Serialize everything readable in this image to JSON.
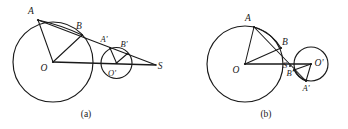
{
  "figure": {
    "type": "geometry-diagram",
    "panels": [
      {
        "id": "a",
        "caption": "(a)",
        "caption_pos": {
          "x": 86,
          "y": 116
        },
        "description": "Two externally separated circles with a common external tangent-like transversal meeting at external homothety center S",
        "circles": [
          {
            "name": "big-circle",
            "cx": 53,
            "cy": 62,
            "r": 40,
            "center_label": "O",
            "center_label_pos": {
              "x": 44,
              "y": 70
            }
          },
          {
            "name": "small-circle",
            "cx": 116.5,
            "cy": 63,
            "r": 15.5,
            "center_label": "O'",
            "center_label_pos": {
              "x": 110,
              "y": 75
            }
          }
        ],
        "points": [
          {
            "label": "A",
            "x": 38,
            "y": 20,
            "label_x": 31,
            "label_y": 14
          },
          {
            "label": "B",
            "x": 82,
            "y": 35,
            "label_x": 79,
            "label_y": 29
          },
          {
            "label": "A'",
            "x": 110,
            "y": 48,
            "label_x": 104,
            "label_y": 42
          },
          {
            "label": "B'",
            "x": 127,
            "y": 54,
            "label_x": 123,
            "label_y": 47
          },
          {
            "label": "O",
            "x": 53,
            "y": 62,
            "label_x": 44,
            "label_y": 71
          },
          {
            "label": "O'",
            "x": 116.5,
            "y": 63,
            "label_x": 110,
            "label_y": 75
          },
          {
            "label": "S",
            "x": 156,
            "y": 65,
            "label_x": 159,
            "label_y": 68
          }
        ],
        "segments": [
          {
            "name": "OA",
            "from": "O",
            "to": "A"
          },
          {
            "name": "OB",
            "from": "O",
            "to": "B"
          },
          {
            "name": "OS-axis",
            "from": "O",
            "to": "S"
          },
          {
            "name": "OprimeA-prime",
            "from": "O'",
            "to": "A'"
          },
          {
            "name": "OprimeB-prime",
            "from": "O'",
            "to": "B'"
          },
          {
            "name": "transversal-A-S",
            "from": "A",
            "to": "S"
          }
        ]
      },
      {
        "id": "b",
        "caption": "(b)",
        "caption_pos": {
          "x": 266,
          "y": 116
        },
        "description": "Two tangent circles with transversal through the internal homothety center S between them",
        "circles": [
          {
            "name": "big-circle",
            "cx": 245,
            "cy": 64,
            "r": 38,
            "center_label": "O",
            "center_label_pos": {
              "x": 236,
              "y": 72
            }
          },
          {
            "name": "small-circle",
            "cx": 311,
            "cy": 64,
            "r": 17,
            "center_label": "O'",
            "center_label_pos": {
              "x": 314,
              "y": 64
            }
          }
        ],
        "points": [
          {
            "label": "A",
            "x": 254,
            "y": 27,
            "label_x": 248,
            "label_y": 21
          },
          {
            "label": "B",
            "x": 281,
            "y": 48,
            "label_x": 283,
            "label_y": 44
          },
          {
            "label": "S",
            "x": 290,
            "y": 66,
            "label_x": 284,
            "label_y": 66
          },
          {
            "label": "B'",
            "x": 294,
            "y": 70,
            "label_x": 289,
            "label_y": 74
          },
          {
            "label": "A'",
            "x": 306,
            "y": 81,
            "label_x": 305,
            "label_y": 89
          },
          {
            "label": "O",
            "x": 245,
            "y": 64,
            "label_x": 236,
            "label_y": 72
          },
          {
            "label": "O'",
            "x": 311,
            "y": 64,
            "label_x": 315,
            "label_y": 64
          }
        ],
        "segments": [
          {
            "name": "OA",
            "from": "O",
            "to": "A"
          },
          {
            "name": "OB",
            "from": "O",
            "to": "B"
          },
          {
            "name": "OOprime-axis",
            "from": "O",
            "to": "O'"
          },
          {
            "name": "OprimeA-prime",
            "from": "O'",
            "to": "A'"
          },
          {
            "name": "OprimeB-prime",
            "from": "O'",
            "to": "B'"
          },
          {
            "name": "transversal-A-A-prime",
            "from": "A",
            "to": "A'"
          }
        ]
      }
    ],
    "style": {
      "stroke_color": "#1a1a1a",
      "background_color": "#ffffff"
    }
  }
}
